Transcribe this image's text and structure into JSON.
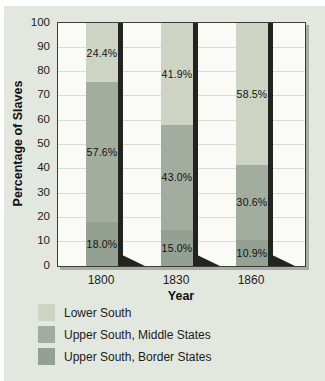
{
  "figure": {
    "background": "#e2e7df",
    "plot_background": "#fafbf7",
    "grid_color": "#d8dcd3",
    "frame_color": "#3c3c3c",
    "frame_shadow": "rgba(110,116,105,0.5)",
    "bar_shadow_color": "#23231f",
    "text_color": "#1c1c1c"
  },
  "chart_data": {
    "type": "bar",
    "stacked": true,
    "title": "",
    "xlabel": "Year",
    "ylabel": "Percentage of Slaves",
    "ylim": [
      0,
      100
    ],
    "yticks": [
      0,
      10,
      20,
      30,
      40,
      50,
      60,
      70,
      80,
      90,
      100
    ],
    "grid": true,
    "categories": [
      "1800",
      "1830",
      "1860"
    ],
    "series": [
      {
        "name": "Upper South, Border States",
        "color": "#93a092",
        "values": [
          18.0,
          15.0,
          10.9
        ],
        "labels": [
          "18.0%",
          "15.0%",
          "10.9%"
        ]
      },
      {
        "name": "Upper South, Middle States",
        "color": "#a2ac9f",
        "values": [
          57.6,
          43.0,
          30.6
        ],
        "labels": [
          "57.6%",
          "43.0%",
          "30.6%"
        ]
      },
      {
        "name": "Lower South",
        "color": "#cdd4c4",
        "values": [
          24.4,
          41.9,
          58.5
        ],
        "labels": [
          "24.4%",
          "41.9%",
          "58.5%"
        ]
      }
    ],
    "legend": [
      {
        "label": "Lower South",
        "color": "#cdd4c4"
      },
      {
        "label": "Upper South, Middle States",
        "color": "#a2ac9f"
      },
      {
        "label": "Upper South, Border States",
        "color": "#93a092"
      }
    ],
    "legend_position": "bottom-left"
  }
}
